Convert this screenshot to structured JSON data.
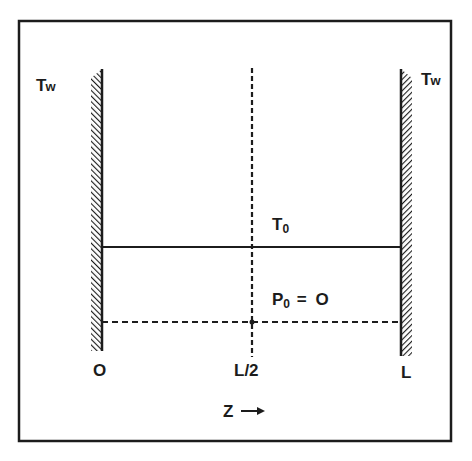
{
  "diagram": {
    "title": "",
    "colors": {
      "line": "#1c1c1c",
      "background": "#ffffff"
    },
    "walls": {
      "left": {
        "label": "T",
        "label_sub": "w",
        "position_label": "O"
      },
      "right": {
        "label": "T",
        "label_sub": "w",
        "position_label": "L"
      }
    },
    "midplane": {
      "position_label": "L/2",
      "style": "dashed"
    },
    "lines": {
      "temperature": {
        "label": "T",
        "label_sub": "0",
        "style": "solid"
      },
      "pressure": {
        "label": "P",
        "label_sub": "0",
        "suffix": " = O",
        "style": "dashed"
      }
    },
    "axis": {
      "variable": "Z",
      "arrow": "→"
    }
  }
}
